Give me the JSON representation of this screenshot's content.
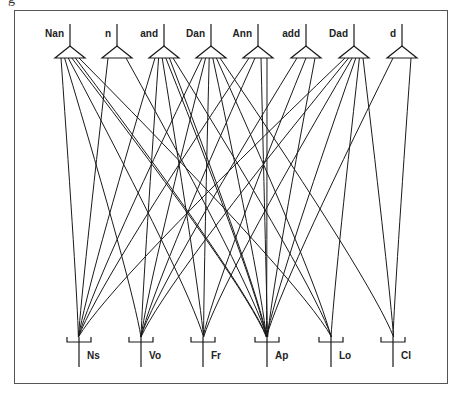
{
  "figure": {
    "caption_fragment": "g",
    "colors": {
      "line": "#1a1a1a",
      "frame": "#555555",
      "background": "#ffffff"
    }
  },
  "top_nodes": [
    {
      "label": "Nan",
      "x": 70
    },
    {
      "label": "n",
      "x": 117
    },
    {
      "label": "and",
      "x": 164
    },
    {
      "label": "Dan",
      "x": 211
    },
    {
      "label": "Ann",
      "x": 258
    },
    {
      "label": "add",
      "x": 306
    },
    {
      "label": "Dad",
      "x": 354
    },
    {
      "label": "d",
      "x": 402
    }
  ],
  "bottom_nodes": [
    {
      "label": "Ns",
      "x": 79
    },
    {
      "label": "Vo",
      "x": 141
    },
    {
      "label": "Fr",
      "x": 203
    },
    {
      "label": "Ap",
      "x": 267
    },
    {
      "label": "Lo",
      "x": 331
    },
    {
      "label": "Cl",
      "x": 393
    }
  ],
  "connections": [
    [
      0,
      0
    ],
    [
      0,
      1
    ],
    [
      0,
      3
    ],
    [
      0,
      3
    ],
    [
      0,
      4
    ],
    [
      0,
      2
    ],
    [
      1,
      0
    ],
    [
      1,
      3
    ],
    [
      2,
      0
    ],
    [
      2,
      1
    ],
    [
      2,
      3
    ],
    [
      2,
      2
    ],
    [
      2,
      4
    ],
    [
      2,
      3
    ],
    [
      3,
      1
    ],
    [
      3,
      2
    ],
    [
      3,
      3
    ],
    [
      3,
      5
    ],
    [
      3,
      0
    ],
    [
      3,
      4
    ],
    [
      4,
      0
    ],
    [
      4,
      1
    ],
    [
      4,
      3
    ],
    [
      4,
      3
    ],
    [
      5,
      1
    ],
    [
      5,
      2
    ],
    [
      5,
      3
    ],
    [
      6,
      1
    ],
    [
      6,
      2
    ],
    [
      6,
      3
    ],
    [
      6,
      5
    ],
    [
      6,
      0
    ],
    [
      6,
      4
    ],
    [
      7,
      3
    ],
    [
      7,
      5
    ]
  ]
}
